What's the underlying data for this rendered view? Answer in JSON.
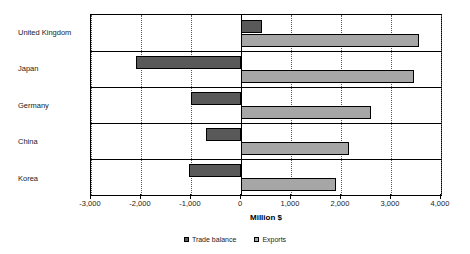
{
  "chart_data": {
    "type": "bar",
    "orientation": "horizontal",
    "title": "",
    "xlabel": "Million $",
    "ylabel": "",
    "xlim": [
      -3000,
      4000
    ],
    "xticks": [
      -3000,
      -2000,
      -1000,
      0,
      1000,
      2000,
      3000,
      4000
    ],
    "xtick_labels": [
      "-3,000",
      "-2,000",
      "-1,000",
      "0",
      "1,000",
      "2,000",
      "3,000",
      "4,000"
    ],
    "grid": true,
    "legend_position": "bottom",
    "categories": [
      "United Kingdom",
      "Japan",
      "Germany",
      "China",
      "Korea"
    ],
    "series": [
      {
        "name": "Trade balance",
        "color": "#595959",
        "values": [
          420,
          -2100,
          -1000,
          -700,
          -1050
        ]
      },
      {
        "name": "Exports",
        "color": "#a6a6a6",
        "values": [
          3550,
          3450,
          2600,
          2150,
          1900
        ]
      }
    ]
  },
  "legend": {
    "entries": [
      {
        "label": "Trade balance"
      },
      {
        "label": "Exports"
      }
    ]
  }
}
